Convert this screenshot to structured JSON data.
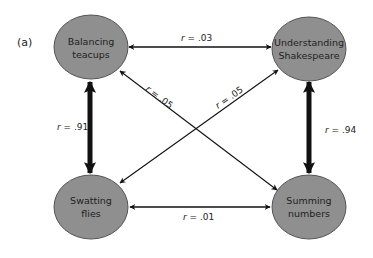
{
  "panel_label": "(a)",
  "colors": {
    "node_fill": "#8f8f8f",
    "node_stroke": "#555555",
    "edge": "#111111",
    "text": "#222222"
  },
  "nodes": [
    {
      "id": "teacups",
      "lines": [
        "Balancing",
        "teacups"
      ]
    },
    {
      "id": "shakespeare",
      "lines": [
        "Understanding",
        "Shakespeare"
      ]
    },
    {
      "id": "flies",
      "lines": [
        "Swatting",
        "flies"
      ]
    },
    {
      "id": "numbers",
      "lines": [
        "Summing",
        "numbers"
      ]
    }
  ],
  "edges": [
    {
      "from": "teacups",
      "to": "shakespeare",
      "r_symbol": "r",
      "r_value": " = .03",
      "strength": "weak"
    },
    {
      "from": "teacups",
      "to": "numbers",
      "r_symbol": "r",
      "r_value": " = .05",
      "strength": "weak"
    },
    {
      "from": "flies",
      "to": "shakespeare",
      "r_symbol": "r",
      "r_value": " = .05",
      "strength": "weak"
    },
    {
      "from": "teacups",
      "to": "flies",
      "r_symbol": "r",
      "r_value": " = .91",
      "strength": "strong"
    },
    {
      "from": "shakespeare",
      "to": "numbers",
      "r_symbol": "r",
      "r_value": " = .94",
      "strength": "strong"
    },
    {
      "from": "flies",
      "to": "numbers",
      "r_symbol": "r",
      "r_value": " = .01",
      "strength": "weak"
    }
  ]
}
